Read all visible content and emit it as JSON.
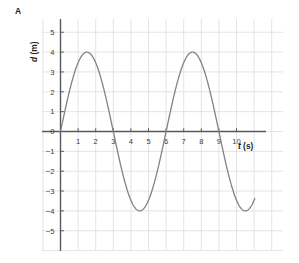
{
  "panel": {
    "label": "A"
  },
  "chart_data": {
    "type": "line",
    "title": "",
    "subtitle": "",
    "xlabel": "t (s)",
    "xlabel_italic_part": "t",
    "xlabel_unit_part": " (s)",
    "ylabel": "d (m)",
    "ylabel_italic_part": "d",
    "ylabel_unit_part": " (m)",
    "xlim": [
      -0.2,
      12.0
    ],
    "ylim": [
      -5.6,
      5.8
    ],
    "xticks": [
      1,
      2,
      3,
      4,
      5,
      6,
      7,
      8,
      9,
      10
    ],
    "xtick_labels": [
      "1",
      "2",
      "3",
      "4",
      "5",
      "6",
      "7",
      "8",
      "9",
      "10"
    ],
    "yticks": [
      -5,
      -4,
      -3,
      -2,
      -1,
      0,
      1,
      2,
      3,
      4,
      5
    ],
    "ytick_labels": [
      "−5",
      "−4",
      "−3",
      "−2",
      "−1",
      "0",
      "1",
      "2",
      "3",
      "4",
      "5"
    ],
    "grid": true,
    "grid_color": "#d9dde2",
    "axis_color": "#58595b",
    "legend": null,
    "series": [
      {
        "name": "displacement",
        "color": "#808285",
        "line_width": 1.3,
        "function": "d = 4 sin(2*pi*t/6)",
        "amplitude": 4,
        "period": 6,
        "t_start": 0,
        "t_end": 11.05,
        "x": [
          0,
          0.25,
          0.5,
          0.75,
          1,
          1.25,
          1.5,
          1.75,
          2,
          2.25,
          2.5,
          2.75,
          3,
          3.25,
          3.5,
          3.75,
          4,
          4.25,
          4.5,
          4.75,
          5,
          5.25,
          5.5,
          5.75,
          6,
          6.25,
          6.5,
          6.75,
          7,
          7.25,
          7.5,
          7.75,
          8,
          8.25,
          8.5,
          8.75,
          9,
          9.25,
          9.5,
          9.75,
          10,
          10.25,
          10.5,
          10.75,
          11.05
        ],
        "y": [
          0,
          1.03,
          2.0,
          2.83,
          3.46,
          3.86,
          4.0,
          3.86,
          3.46,
          2.83,
          2.0,
          1.03,
          0,
          -1.03,
          -2.0,
          -2.83,
          -3.46,
          -3.86,
          -4.0,
          -3.86,
          -3.46,
          -2.83,
          -2.0,
          -1.03,
          0,
          1.03,
          2.0,
          2.83,
          3.46,
          3.86,
          4.0,
          3.86,
          3.46,
          2.83,
          2.0,
          1.03,
          0,
          -1.03,
          -2.0,
          -2.83,
          -3.46,
          -3.86,
          -4.0,
          -3.86,
          -3.62
        ]
      }
    ],
    "key_points": {
      "maxima": [
        {
          "t": 1.5,
          "d": 4
        },
        {
          "t": 7.5,
          "d": 4
        }
      ],
      "minima": [
        {
          "t": 4.5,
          "d": -4
        },
        {
          "t": 10.5,
          "d": -4
        }
      ],
      "zero_crossings": [
        0,
        3,
        6,
        9
      ]
    }
  }
}
